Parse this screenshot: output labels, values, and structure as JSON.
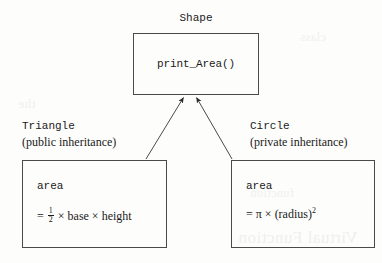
{
  "diagram": {
    "type": "class-inheritance-diagram",
    "base_class": {
      "name": "Shape",
      "method": "print_Area()"
    },
    "derived_classes": [
      {
        "name": "Triangle",
        "inheritance_note": "(public inheritance)",
        "attribute": "area",
        "formula_prefix": "=",
        "fraction_numerator": "1",
        "fraction_denominator": "2",
        "formula_rest_1": "× base × height"
      },
      {
        "name": "Circle",
        "inheritance_note": "(private inheritance)",
        "attribute": "area",
        "formula_prefix": "=",
        "formula_pi": "π",
        "formula_times": "×",
        "formula_paren": "(radius)",
        "formula_exponent": "2"
      }
    ],
    "arrow_direction": "derived-to-base",
    "line_color": "#4a4a4a",
    "background_color": "#fdfdfc",
    "text_color": "#1a1a1a"
  },
  "bleed": {
    "a": "Virtual Function",
    "b": "the",
    "c": "function",
    "d": "class"
  }
}
